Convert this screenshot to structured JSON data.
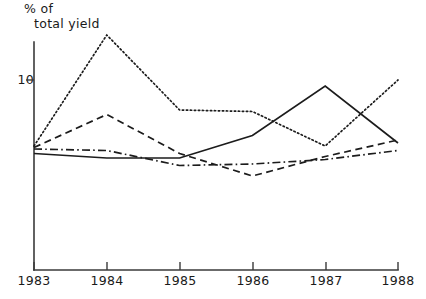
{
  "chart_data": {
    "type": "line",
    "title": "",
    "ylabel": "% of total yield",
    "xlabel": "",
    "categories": [
      "1983",
      "1984",
      "1985",
      "1986",
      "1987",
      "1988"
    ],
    "x": [
      1983,
      1984,
      1985,
      1986,
      1987,
      1988
    ],
    "ylim": [
      0,
      14
    ],
    "yticks": [
      10
    ],
    "ytick_labels": [
      "10"
    ],
    "grid": false,
    "legend": "none",
    "series": [
      {
        "name": "series-dotted",
        "style": "dotted",
        "values": [
          5.6,
          13.0,
          8.0,
          7.9,
          5.6,
          10.0
        ]
      },
      {
        "name": "series-dashed",
        "style": "dashed",
        "values": [
          5.5,
          7.7,
          5.1,
          3.6,
          4.9,
          6.0
        ]
      },
      {
        "name": "series-solid",
        "style": "solid",
        "values": [
          5.1,
          4.8,
          4.8,
          6.3,
          9.6,
          5.8
        ]
      },
      {
        "name": "series-dashdot",
        "style": "dash-dot",
        "values": [
          5.4,
          5.3,
          4.3,
          4.4,
          4.7,
          5.3
        ]
      }
    ]
  },
  "axis": {
    "y_label_line1": "% of",
    "y_label_line2": "total yield",
    "y_tick_10": "10",
    "x_tick_1983": "1983",
    "x_tick_1984": "1984",
    "x_tick_1985": "1985",
    "x_tick_1986": "1986",
    "x_tick_1987": "1987",
    "x_tick_1988": "1988"
  },
  "colors": {
    "ink": "#1c1c1c",
    "axis": "#3a3a3a",
    "background": "#ffffff"
  }
}
